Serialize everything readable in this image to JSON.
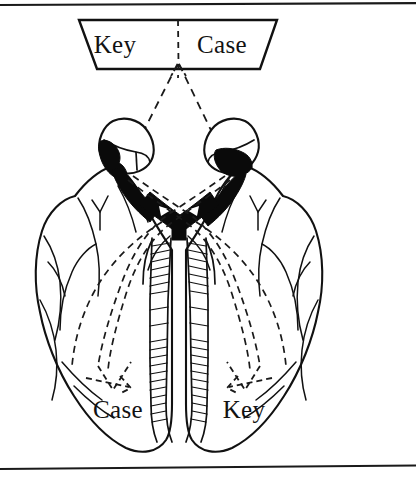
{
  "figure": {
    "background_color": "#ffffff",
    "ink_color": "#111111",
    "width": 417,
    "height": 479
  },
  "rules": {
    "top_rule_label": "top-horizontal-rule",
    "bottom_rule_label": "bottom-horizontal-rule"
  },
  "visual_field": {
    "shape": "trapezoid",
    "left_label": "Key",
    "right_label": "Case",
    "divider": "dashed-vertical-divider"
  },
  "hemisphere_labels": {
    "left_label": "Case",
    "right_label": "Key"
  },
  "anatomy": {
    "left_eye": "left-eye",
    "right_eye": "right-eye",
    "left_retina_shaded": "left-retina-nasal-shading",
    "right_retina_shaded": "right-retina-nasal-shading",
    "optic_chiasm": "optic-chiasm",
    "left_optic_nerve": "left-optic-nerve",
    "right_optic_nerve": "right-optic-nerve",
    "brainstem": "brainstem",
    "left_hemisphere": "left-cerebral-hemisphere",
    "right_hemisphere": "right-cerebral-hemisphere",
    "left_cerebellum": "left-cerebellar-lobe",
    "right_cerebellum": "right-cerebellar-lobe"
  },
  "pathways": {
    "focal_point": "fixation-point",
    "ray_left": "dashed-ray-to-left-eye",
    "ray_right": "dashed-ray-to-right-eye",
    "tract_left_to_right": "dashed-tract-left-field-to-right-hemisphere",
    "tract_right_to_left": "dashed-tract-right-field-to-left-hemisphere",
    "arrow_left": "arrowhead-left-occipital",
    "arrow_right": "arrowhead-right-occipital"
  }
}
